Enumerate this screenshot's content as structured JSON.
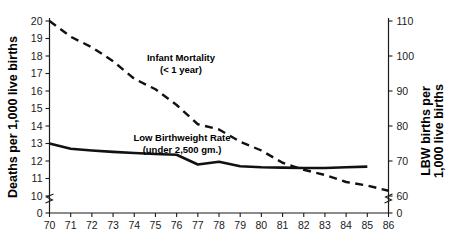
{
  "chart_data": {
    "type": "line",
    "title": "",
    "xlabel": "",
    "x": [
      70,
      71,
      72,
      73,
      74,
      75,
      76,
      77,
      78,
      79,
      80,
      81,
      82,
      83,
      84,
      85,
      86
    ],
    "xtick_labels": [
      "70",
      "71",
      "72",
      "73",
      "74",
      "75",
      "76",
      "77",
      "78",
      "79",
      "80",
      "81",
      "82",
      "83",
      "84",
      "85",
      "86"
    ],
    "grid": false,
    "legend_position": "inline-annotations",
    "left_axis": {
      "label": "Deaths per 1,000 live births",
      "ticks": [
        0,
        10,
        11,
        12,
        13,
        14,
        15,
        16,
        17,
        18,
        19,
        20
      ],
      "tick_labels": [
        "0",
        "10",
        "11",
        "12",
        "13",
        "14",
        "15",
        "16",
        "17",
        "18",
        "19",
        "20"
      ],
      "ylim": [
        10,
        20
      ],
      "axis_break": true,
      "zero_tick_label": "0"
    },
    "right_axis": {
      "label": "LBW births per 1,000 live births",
      "ticks": [
        0,
        60,
        70,
        80,
        90,
        100,
        110
      ],
      "tick_labels": [
        "0",
        "60",
        "70",
        "80",
        "90",
        "100",
        "110"
      ],
      "ylim": [
        60,
        110
      ],
      "axis_break": true,
      "zero_tick_label": "0"
    },
    "series": [
      {
        "name": "Infant Mortality",
        "annotation_line1": "Infant Mortality",
        "annotation_line2": "(< 1 year)",
        "style": "dashed",
        "color": "#111111",
        "axis": "left",
        "x": [
          70,
          71,
          72,
          73,
          74,
          75,
          76,
          77,
          78,
          79,
          80,
          81,
          82,
          83,
          84,
          85,
          86
        ],
        "values": [
          20.0,
          19.1,
          18.5,
          17.7,
          16.7,
          16.1,
          15.2,
          14.1,
          13.8,
          13.1,
          12.6,
          11.9,
          11.5,
          11.2,
          10.8,
          10.6,
          10.3
        ]
      },
      {
        "name": "Low Birthweight Rate",
        "annotation_line1": "Low Birthweight Rate",
        "annotation_line2": "(under 2,500 gm.)",
        "style": "solid",
        "color": "#111111",
        "axis": "right",
        "x": [
          70,
          71,
          72,
          73,
          74,
          75,
          76,
          77,
          78,
          79,
          80,
          81,
          82,
          83,
          84,
          85
        ],
        "values": [
          75.0,
          73.5,
          73.0,
          72.6,
          72.3,
          72.0,
          71.8,
          69.0,
          69.8,
          68.5,
          68.2,
          68.1,
          68.0,
          68.0,
          68.2,
          68.4
        ]
      }
    ]
  },
  "cut_title": "",
  "colors": {
    "ink": "#111111",
    "axis": "#1a1a1a",
    "background": "#ffffff"
  }
}
